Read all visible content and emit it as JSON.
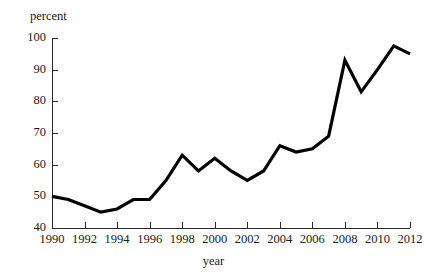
{
  "chart_data": {
    "type": "line",
    "title": "",
    "xlabel": "year",
    "ylabel": "percent",
    "xlim": [
      1990,
      2012
    ],
    "ylim": [
      40,
      100
    ],
    "grid": false,
    "legend": "none",
    "line_color": "#000000",
    "x_ticks": [
      1990,
      1992,
      1994,
      1996,
      1998,
      2000,
      2002,
      2004,
      2006,
      2008,
      2010,
      2012
    ],
    "y_ticks": [
      40,
      50,
      60,
      70,
      80,
      90,
      100
    ],
    "x": [
      1990,
      1991,
      1992,
      1993,
      1994,
      1995,
      1996,
      1997,
      1998,
      1999,
      2000,
      2001,
      2002,
      2003,
      2004,
      2005,
      2006,
      2007,
      2008,
      2009,
      2010,
      2011,
      2012
    ],
    "values": [
      50,
      49,
      47,
      45,
      46,
      49,
      49,
      55,
      63,
      58,
      62,
      58,
      55,
      58,
      66,
      64,
      65,
      69,
      93,
      83,
      90,
      97.5,
      95
    ]
  },
  "axes": {
    "y_title": "percent",
    "x_title": "year"
  }
}
